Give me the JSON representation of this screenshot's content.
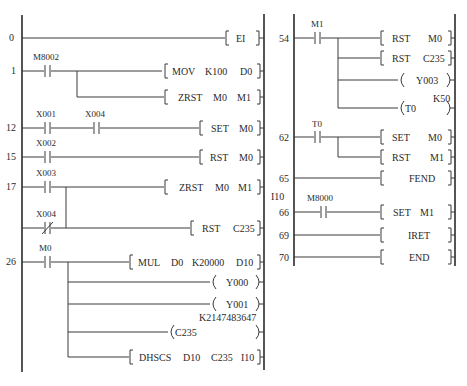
{
  "left_diagram": {
    "rungs": [
      {
        "step": "0",
        "instruction": {
          "op": "EI",
          "args": []
        }
      },
      {
        "step": "1",
        "contacts": [
          {
            "label": "M8002",
            "type": "NO"
          }
        ],
        "outputs": [
          {
            "op": "MOV",
            "args": [
              "K100",
              "D0"
            ]
          },
          {
            "op": "ZRST",
            "args": [
              "M0",
              "M1"
            ]
          }
        ]
      },
      {
        "step": "12",
        "contacts": [
          {
            "label": "X001",
            "type": "NO"
          },
          {
            "label": "X004",
            "type": "NO"
          }
        ],
        "outputs": [
          {
            "op": "SET",
            "args": [
              "M0"
            ]
          }
        ]
      },
      {
        "step": "15",
        "contacts": [
          {
            "label": "X002",
            "type": "NO"
          }
        ],
        "outputs": [
          {
            "op": "RST",
            "args": [
              "M0"
            ]
          }
        ]
      },
      {
        "step": "17",
        "contacts": [
          {
            "label": "X003",
            "type": "NO"
          },
          {
            "label": "X004",
            "type": "NC"
          }
        ],
        "outputs": [
          {
            "op": "ZRST",
            "args": [
              "M0",
              "M1"
            ]
          },
          {
            "op": "RST",
            "args": [
              "C235"
            ]
          }
        ]
      },
      {
        "step": "26",
        "contacts": [
          {
            "label": "M0",
            "type": "NO"
          }
        ],
        "outputs": [
          {
            "op": "MUL",
            "args": [
              "D0",
              "K20000",
              "D10"
            ]
          },
          {
            "coil": "Y000"
          },
          {
            "coil": "Y001"
          },
          {
            "coil": "C235",
            "setting": "K2147483647"
          },
          {
            "op": "DHSCS",
            "args": [
              "D10",
              "C235",
              "I10"
            ]
          }
        ]
      }
    ]
  },
  "right_diagram": {
    "rungs": [
      {
        "step": "54",
        "contacts": [
          {
            "label": "M1",
            "type": "NO"
          }
        ],
        "outputs": [
          {
            "op": "RST",
            "args": [
              "M0"
            ]
          },
          {
            "op": "RST",
            "args": [
              "C235"
            ]
          },
          {
            "coil": "Y003"
          },
          {
            "coil": "T0",
            "setting": "K50"
          }
        ]
      },
      {
        "step": "62",
        "contacts": [
          {
            "label": "T0",
            "type": "NO"
          }
        ],
        "outputs": [
          {
            "op": "SET",
            "args": [
              "M0"
            ]
          },
          {
            "op": "RST",
            "args": [
              "M1"
            ]
          }
        ]
      },
      {
        "step": "65",
        "outputs": [
          {
            "op": "FEND",
            "args": []
          }
        ]
      },
      {
        "step": "66",
        "pointer": "I10",
        "contacts": [
          {
            "label": "M8000",
            "type": "NO"
          }
        ],
        "outputs": [
          {
            "op": "SET",
            "args": [
              "M1"
            ]
          }
        ]
      },
      {
        "step": "69",
        "outputs": [
          {
            "op": "IRET",
            "args": []
          }
        ]
      },
      {
        "step": "70",
        "outputs": [
          {
            "op": "END",
            "args": []
          }
        ]
      }
    ]
  },
  "labels": {
    "s0": "0",
    "s1": "1",
    "s12": "12",
    "s15": "15",
    "s17": "17",
    "s26": "26",
    "s54": "54",
    "s62": "62",
    "s65": "65",
    "s66": "66",
    "s69": "69",
    "s70": "70",
    "M8002": "M8002",
    "X001": "X001",
    "X004": "X004",
    "X002": "X002",
    "X003": "X003",
    "X004b": "X004",
    "M0c": "M0",
    "M1c": "M1",
    "T0c": "T0",
    "M8000": "M8000",
    "I10": "I10",
    "EI": "EI",
    "MOV": "MOV",
    "K100": "K100",
    "D0": "D0",
    "ZRST": "ZRST",
    "M0": "M0",
    "M1": "M1",
    "SET": "SET",
    "RST": "RST",
    "C235": "C235",
    "MUL": "MUL",
    "K20000": "K20000",
    "D10": "D10",
    "Y000": "Y000",
    "Y001": "Y001",
    "K2147483647": "K2147483647",
    "DHSCS": "DHSCS",
    "Y003": "Y003",
    "T0": "T0",
    "K50": "K50",
    "FEND": "FEND",
    "IRET": "IRET",
    "END": "END"
  }
}
